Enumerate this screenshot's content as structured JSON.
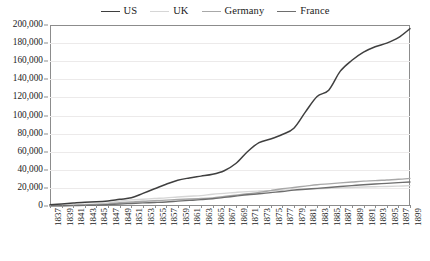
{
  "chart_data": {
    "type": "line",
    "title": "",
    "xlabel": "",
    "ylabel": "",
    "ylim": [
      0,
      200000
    ],
    "ytick_labels": [
      "0",
      "20,000",
      "40,000",
      "60,000",
      "80,000",
      "100,000",
      "120,000",
      "140,000",
      "160,000",
      "180,000",
      "200,000"
    ],
    "ytick_values": [
      0,
      20000,
      40000,
      60000,
      80000,
      100000,
      120000,
      140000,
      160000,
      180000,
      200000
    ],
    "grid": true,
    "legend_position": "top-center",
    "x": [
      1837,
      1839,
      1841,
      1843,
      1845,
      1847,
      1849,
      1851,
      1853,
      1855,
      1857,
      1859,
      1861,
      1863,
      1865,
      1867,
      1869,
      1871,
      1873,
      1875,
      1877,
      1879,
      1881,
      1883,
      1885,
      1887,
      1889,
      1891,
      1893,
      1895,
      1897,
      1899
    ],
    "xtick_labels": [
      "1837",
      "1839",
      "1841",
      "1843",
      "1845",
      "1847",
      "1849",
      "1851",
      "1853",
      "1855",
      "1857",
      "1859",
      "1861",
      "1863",
      "1865",
      "1867",
      "1869",
      "1871",
      "1873",
      "1875",
      "1877",
      "1879",
      "1881",
      "1883",
      "1885",
      "1887",
      "1889",
      "1891",
      "1893",
      "1895",
      "1897",
      "1899"
    ],
    "series": [
      {
        "name": "US",
        "color": "#3f3f3f",
        "values": [
          1500,
          2300,
          3300,
          4200,
          4600,
          5600,
          7400,
          9000,
          14000,
          19000,
          24000,
          28500,
          31000,
          33000,
          35000,
          39000,
          47000,
          60000,
          70000,
          74000,
          79000,
          86000,
          104000,
          121000,
          128000,
          149000,
          161000,
          170000,
          176000,
          180000,
          186000,
          196000
        ]
      },
      {
        "name": "UK",
        "color": "#d6d6d6",
        "values": [
          500,
          900,
          1400,
          1900,
          2400,
          3500,
          5500,
          6800,
          7500,
          8300,
          9000,
          10000,
          10800,
          11500,
          13000,
          14000,
          15000,
          15900,
          16500,
          17000,
          17500,
          18000,
          18500,
          19000,
          19500,
          20000,
          20500,
          21000,
          21300,
          21600,
          22000,
          22500
        ]
      },
      {
        "name": "Germany",
        "color": "#a8a8a8",
        "values": [
          100,
          300,
          700,
          1200,
          1700,
          2400,
          3600,
          4400,
          5300,
          5800,
          6500,
          7200,
          7800,
          8300,
          9000,
          10500,
          12000,
          13500,
          15000,
          17000,
          19000,
          20500,
          22000,
          23500,
          24500,
          25500,
          26500,
          27500,
          28000,
          28800,
          29500,
          30500
        ]
      },
      {
        "name": "France",
        "color": "#6e6e6e",
        "values": [
          100,
          200,
          400,
          700,
          900,
          1500,
          2200,
          2800,
          3400,
          3900,
          4500,
          5400,
          6200,
          7000,
          8000,
          9500,
          11000,
          12500,
          13500,
          14800,
          16000,
          17500,
          18500,
          19500,
          20500,
          21500,
          22500,
          23500,
          24300,
          25000,
          25800,
          26500
        ]
      }
    ]
  }
}
